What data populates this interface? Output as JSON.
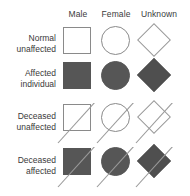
{
  "legend": {
    "title": "Pedigree symbol legend",
    "columns": [
      {
        "key": "male",
        "label": "Male",
        "shape": "square"
      },
      {
        "key": "female",
        "label": "Female",
        "shape": "circle"
      },
      {
        "key": "unknown",
        "label": "Unknown",
        "shape": "diamond"
      }
    ],
    "rows": [
      {
        "key": "normal-unaffected",
        "label_line1": "Normal",
        "label_line2": "unaffected",
        "filled": false,
        "deceased": false
      },
      {
        "key": "affected-individual",
        "label_line1": "Affected",
        "label_line2": "individual",
        "filled": true,
        "deceased": false
      },
      {
        "key": "deceased-unaffected",
        "label_line1": "Deceased",
        "label_line2": "unaffected",
        "filled": false,
        "deceased": true
      },
      {
        "key": "deceased-affected",
        "label_line1": "Deceased",
        "label_line2": "affected",
        "filled": true,
        "deceased": true
      }
    ],
    "colors": {
      "outline": "#8a8a8a",
      "fill": "#565656",
      "slash": "#9a9a9a",
      "text": "#3a3a3a",
      "background": "#ffffff"
    }
  }
}
